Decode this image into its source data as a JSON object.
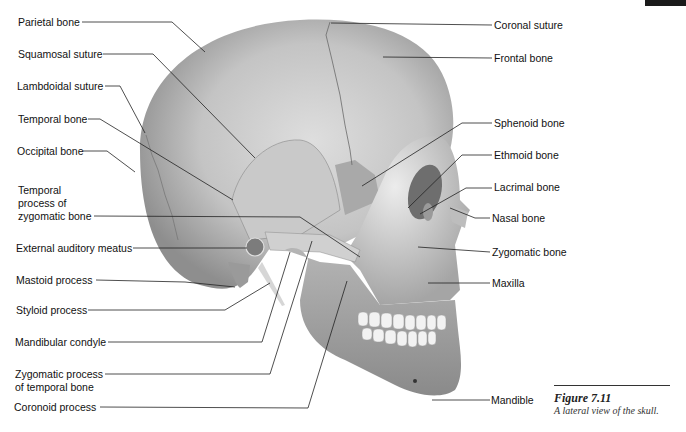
{
  "figure": {
    "number": "Figure 7.11",
    "caption": "A lateral view of the skull."
  },
  "labels_left": [
    {
      "id": "parietal",
      "text": "Parietal bone"
    },
    {
      "id": "squamosal",
      "text": "Squamosal suture"
    },
    {
      "id": "lambdoidal",
      "text": "Lambdoidal suture"
    },
    {
      "id": "temporal",
      "text": "Temporal bone"
    },
    {
      "id": "occipital",
      "text": "Occipital bone"
    },
    {
      "id": "temporal-process-zygomatic",
      "text": "Temporal\nprocess of\nzygomatic bone"
    },
    {
      "id": "external-auditory-meatus",
      "text": "External auditory meatus"
    },
    {
      "id": "mastoid",
      "text": "Mastoid process"
    },
    {
      "id": "styloid",
      "text": "Styloid process"
    },
    {
      "id": "mandibular-condyle",
      "text": "Mandibular condyle"
    },
    {
      "id": "zygomatic-process-temporal",
      "text": "Zygomatic process\nof temporal bone"
    },
    {
      "id": "coronoid",
      "text": "Coronoid process"
    }
  ],
  "labels_right": [
    {
      "id": "coronal",
      "text": "Coronal suture"
    },
    {
      "id": "frontal",
      "text": "Frontal bone"
    },
    {
      "id": "sphenoid",
      "text": "Sphenoid bone"
    },
    {
      "id": "ethmoid",
      "text": "Ethmoid bone"
    },
    {
      "id": "lacrimal",
      "text": "Lacrimal bone"
    },
    {
      "id": "nasal",
      "text": "Nasal bone"
    },
    {
      "id": "zygomatic",
      "text": "Zygomatic bone"
    },
    {
      "id": "maxilla",
      "text": "Maxilla"
    },
    {
      "id": "mandible",
      "text": "Mandible"
    }
  ],
  "colors": {
    "bone_light": "#d9d9d9",
    "bone_mid": "#b3b3b3",
    "bone_dark": "#8c8c8c",
    "leader_line": "#222222",
    "teeth": "#f2f2f2"
  }
}
